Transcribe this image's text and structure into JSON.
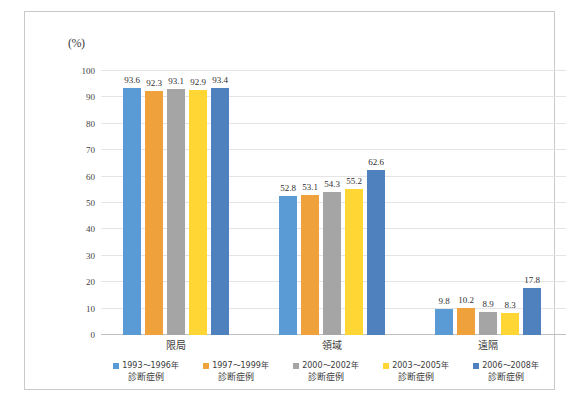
{
  "chart_data": {
    "type": "bar",
    "title": "",
    "subtitle": "",
    "unit_label": "(%)",
    "xlabel": "",
    "ylabel": "",
    "ylim": [
      0,
      100
    ],
    "y_ticks": [
      100,
      90,
      80,
      70,
      60,
      50,
      40,
      30,
      20,
      10,
      0
    ],
    "grid": true,
    "legend_position": "bottom",
    "categories": [
      "限局",
      "領域",
      "遠隔"
    ],
    "series": [
      {
        "name": "1993～1996年診断症例",
        "legend_line1": "1993～1996年",
        "legend_line2": "診断症例",
        "color": "#5B9BD5",
        "values": [
          93.6,
          52.8,
          9.8
        ]
      },
      {
        "name": "1997～1999年診断症例",
        "legend_line1": "1997～1999年",
        "legend_line2": "診断症例",
        "color": "#EFA13C",
        "values": [
          92.3,
          53.1,
          10.2
        ]
      },
      {
        "name": "2000～2002年診断症例",
        "legend_line1": "2000～2002年",
        "legend_line2": "診断症例",
        "color": "#A5A5A5",
        "values": [
          93.1,
          54.3,
          8.9
        ]
      },
      {
        "name": "2003～2005年診断症例",
        "legend_line1": "2003～2005年",
        "legend_line2": "診断症例",
        "color": "#FFD634",
        "values": [
          92.9,
          55.2,
          8.3
        ]
      },
      {
        "name": "2006～2008年診断症例",
        "legend_line1": "2006～2008年",
        "legend_line2": "診断症例",
        "color": "#4E81BD",
        "values": [
          93.4,
          62.6,
          17.8
        ]
      }
    ],
    "value_labels": [
      [
        "93.6",
        "92.3",
        "93.1",
        "92.9",
        "93.4"
      ],
      [
        "52.8",
        "53.1",
        "54.3",
        "55.2",
        "62.6"
      ],
      [
        "9.8",
        "10.2",
        "8.9",
        "8.3",
        "17.8"
      ]
    ]
  },
  "colors": {
    "frame_border": "#c9c9c9",
    "gridline": "#e4e4e4",
    "axis": "#bfbfbf",
    "text": "#3a3a3a",
    "background": "#ffffff"
  }
}
